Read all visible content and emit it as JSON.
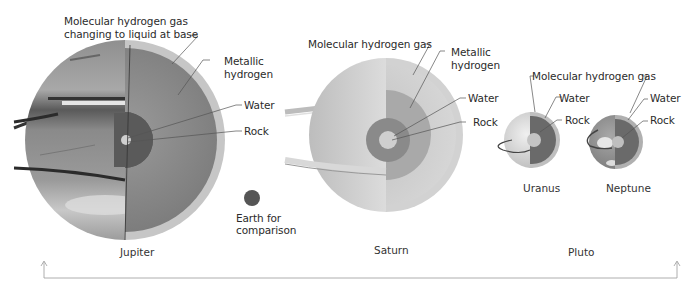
{
  "diagram": {
    "colors": {
      "background": "#ffffff",
      "text": "#2b2b2b",
      "outer_layer": "#bdbdbd",
      "metallic_hydrogen": "#8c8c8c",
      "water_layer": "#5e5e5e",
      "rock_core": "#c8c8c8",
      "leader_line": "#555555",
      "scale_line": "#9a9a9a"
    },
    "planets": {
      "jupiter": {
        "name": "Jupiter",
        "labels": {
          "outer_line1": "Molecular hydrogen gas",
          "outer_line2": "changing to liquid at base",
          "metallic_line1": "Metallic",
          "metallic_line2": "hydrogen",
          "water": "Water",
          "rock": "Rock"
        }
      },
      "saturn": {
        "name": "Saturn",
        "labels": {
          "outer": "Molecular hydrogen gas",
          "metallic_line1": "Metallic",
          "metallic_line2": "hydrogen",
          "water": "Water",
          "rock": "Rock"
        }
      },
      "uranus": {
        "name": "Uranus",
        "labels": {
          "water": "Water",
          "rock": "Rock"
        }
      },
      "neptune": {
        "name": "Neptune",
        "labels": {
          "water": "Water",
          "rock": "Rock"
        }
      },
      "shared_label": "Molecular hydrogen gas"
    },
    "earth": {
      "label_line1": "Earth for",
      "label_line2": "comparison"
    },
    "scale_axis": {
      "left_marker": "Jupiter",
      "middle_marker": "Saturn",
      "right_marker": "Pluto"
    }
  }
}
